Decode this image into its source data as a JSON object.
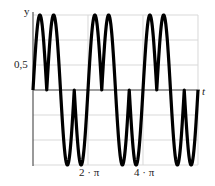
{
  "chart_data": {
    "type": "line",
    "title": "",
    "xlabel": "t",
    "ylabel": "y",
    "x_tick_labels": [
      "2 · π",
      "4 · π"
    ],
    "y_tick_labels": [
      "0,5"
    ],
    "xlim": [
      0,
      18.85
    ],
    "ylim": [
      -1,
      1
    ],
    "grid": true,
    "grid_y_step": 0.333,
    "grid_x_step": 6.283,
    "function_description": "y = sign(sin t) · |sin 2t|, two positive humps then two negative humps per 2π period",
    "series": [
      {
        "name": "y(t)",
        "color": "#000000",
        "line_width": 3,
        "x": [
          0,
          0.785,
          1.571,
          2.356,
          3.142,
          3.927,
          4.712,
          5.498,
          6.283,
          7.069,
          7.854,
          8.639,
          9.425,
          10.21,
          10.996,
          11.781,
          12.566,
          13.352,
          14.137,
          14.923,
          15.708,
          16.493,
          17.279,
          18.064,
          18.85
        ],
        "y": [
          0,
          1,
          0,
          1,
          0,
          -1,
          0,
          -1,
          0,
          1,
          0,
          1,
          0,
          -1,
          0,
          -1,
          0,
          1,
          0,
          1,
          0,
          -1,
          0,
          -1,
          0
        ]
      }
    ]
  },
  "labels": {
    "y_axis": "y",
    "t_axis": "t",
    "y_tick": "0,5",
    "x_tick_1": "2 · π",
    "x_tick_2": "4 · π"
  },
  "colors": {
    "curve": "#000000",
    "grid": "#d9d9d9",
    "axis": "#555555"
  }
}
